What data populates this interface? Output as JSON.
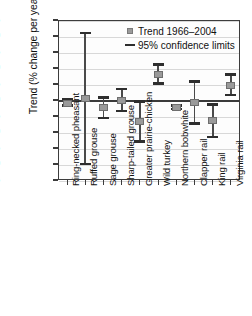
{
  "chart_data": {
    "type": "scatter",
    "title": "",
    "xlabel": "",
    "ylabel": "Trend (% change per year)",
    "ylim": [
      -25,
      25
    ],
    "yticks": [
      25,
      20,
      15,
      10,
      5,
      0,
      -5,
      -10,
      -15,
      -20,
      -25
    ],
    "ytick_labels": [
      "25",
      "20",
      "15",
      "10",
      "5",
      "0",
      "−5",
      "−10",
      "−15",
      "−20",
      "−25"
    ],
    "grid": true,
    "legend_position": "upper right",
    "legend": [
      {
        "label": "Trend 1966–2004",
        "marker": "square",
        "color": "#9a9a9a"
      },
      {
        "label": "95% confidence limits",
        "marker": "bar",
        "color": "#2e2e2e"
      }
    ],
    "categories": [
      "Ring-necked pheasant",
      "Ruffed grouse",
      "Sage grouse",
      "Sharp-tailed grouse",
      "Greater prairie-chicken",
      "Wild turkey",
      "Northern bobwhite",
      "Clapper rail",
      "King rail",
      "Virginia rail"
    ],
    "points": [
      {
        "category": "Ring-necked pheasant",
        "trend": -1.0,
        "ci_low": -1.8,
        "ci_high": 0.3
      },
      {
        "category": "Ruffed grouse",
        "trend": 0.6,
        "ci_low": -20.0,
        "ci_high": 21.0
      },
      {
        "category": "Sage grouse",
        "trend": -2.4,
        "ci_low": -5.6,
        "ci_high": 0.8
      },
      {
        "category": "Sharp-tailed grouse",
        "trend": 0.0,
        "ci_low": -3.4,
        "ci_high": 3.5
      },
      {
        "category": "Greater prairie-chicken",
        "trend": -6.6,
        "ci_low": -13.0,
        "ci_high": -0.5
      },
      {
        "category": "Wild turkey",
        "trend": 8.0,
        "ci_low": 5.1,
        "ci_high": 11.1
      },
      {
        "category": "Northern bobwhite",
        "trend": -2.3,
        "ci_low": -2.8,
        "ci_high": -1.8
      },
      {
        "category": "Clapper rail",
        "trend": -0.8,
        "ci_low": -7.4,
        "ci_high": 5.8
      },
      {
        "category": "King rail",
        "trend": -6.5,
        "ci_low": -11.6,
        "ci_high": -1.4
      },
      {
        "category": "Virginia rail",
        "trend": 4.6,
        "ci_low": 1.5,
        "ci_high": 8.0
      }
    ],
    "series": [
      {
        "name": "Trend 1966–2004",
        "values": [
          -1.0,
          0.6,
          -2.4,
          0.0,
          -6.6,
          8.0,
          -2.3,
          -0.8,
          -6.5,
          4.6
        ]
      },
      {
        "name": "95% confidence limits (lower)",
        "values": [
          -1.8,
          -20.0,
          -5.6,
          -3.4,
          -13.0,
          5.1,
          -2.8,
          -7.4,
          -11.6,
          1.5
        ]
      },
      {
        "name": "95% confidence limits (upper)",
        "values": [
          0.3,
          21.0,
          0.8,
          3.5,
          -0.5,
          11.1,
          -1.8,
          5.8,
          -1.4,
          8.0
        ]
      }
    ]
  }
}
